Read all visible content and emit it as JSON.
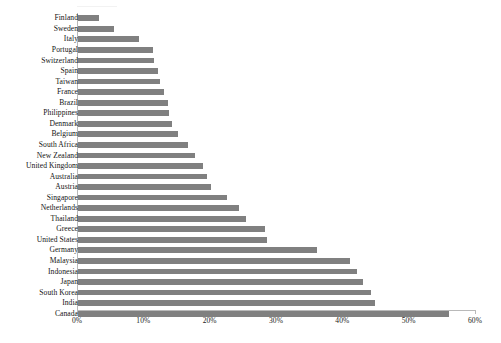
{
  "chart_data": {
    "type": "bar",
    "orientation": "horizontal",
    "title": "",
    "subtitle": "",
    "xlabel": "",
    "ylabel": "",
    "xlim": [
      0,
      60
    ],
    "grid": false,
    "legend": false,
    "legend_position": "none",
    "bar_color": "#808080",
    "axis_color": "#b9b9b9",
    "text_color": "#141414",
    "value_unit": "%",
    "xticks": [
      0,
      10,
      20,
      30,
      40,
      50,
      60
    ],
    "xtick_labels": [
      "0%",
      "10%",
      "20%",
      "30%",
      "40%",
      "50%",
      "60%"
    ],
    "categories": [
      "Finland",
      "Sweden",
      "Italy",
      "Portugal",
      "Switzerland",
      "Spain",
      "Taiwan",
      "France",
      "Brazil",
      "Philippines",
      "Denmark",
      "Belgium",
      "South Africa",
      "New Zealand",
      "United Kingdom",
      "Australia",
      "Austria",
      "Singapore",
      "Netherlands",
      "Thailand",
      "Greece",
      "United States",
      "Germany",
      "Malaysia",
      "Indonesia",
      "Japan",
      "South Korea",
      "India",
      "Canada"
    ],
    "values": [
      3.2,
      5.4,
      9.2,
      11.3,
      11.4,
      12.0,
      12.3,
      12.9,
      13.5,
      13.7,
      14.1,
      15.0,
      16.6,
      17.6,
      18.8,
      19.5,
      20.0,
      22.4,
      24.2,
      25.3,
      28.2,
      28.5,
      36.0,
      41.0,
      42.1,
      43.0,
      44.1,
      44.8,
      56.0
    ]
  }
}
